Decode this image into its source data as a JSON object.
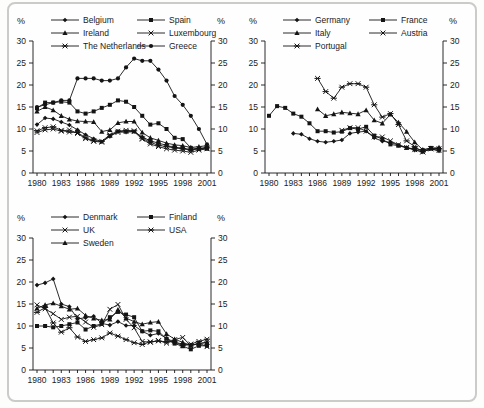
{
  "figure": {
    "border_color": "#c9ccc8",
    "background_color": "#fefefe",
    "line_color": "#141414"
  },
  "chart_data": [
    {
      "type": "line",
      "position": "top-left",
      "title": "",
      "ylabel_left": "%",
      "ylabel_right": "%",
      "ylim": [
        0,
        30
      ],
      "y_ticks": [
        0,
        5,
        10,
        15,
        20,
        25,
        30
      ],
      "x_tick_years": [
        1980,
        1983,
        1986,
        1989,
        1992,
        1995,
        1998,
        2001
      ],
      "years": [
        1980,
        1981,
        1982,
        1983,
        1984,
        1985,
        1986,
        1987,
        1988,
        1989,
        1990,
        1991,
        1992,
        1993,
        1994,
        1995,
        1996,
        1997,
        1998,
        1999,
        2000,
        2001
      ],
      "grid": false,
      "legend_position": "top",
      "series": [
        {
          "name": "Belgium",
          "marker": "diamond",
          "values": [
            11,
            12.5,
            12.3,
            11.6,
            10.9,
            9.8,
            8.7,
            7.8,
            7.1,
            8.3,
            9.5,
            9.3,
            9.4,
            8.2,
            7.3,
            6.8,
            6.3,
            5.8,
            5.7,
            5.3,
            5.6,
            5.8
          ]
        },
        {
          "name": "Spain",
          "marker": "square",
          "values": [
            14.7,
            16,
            16,
            16.2,
            16,
            14,
            13.5,
            14,
            14.8,
            15.5,
            16.5,
            16.2,
            15,
            13,
            11,
            11.3,
            10,
            8,
            7.7,
            5.7,
            5.5,
            5.5
          ]
        },
        {
          "name": "Ireland",
          "marker": "triangle",
          "values": [
            14,
            15,
            14.3,
            13,
            12.2,
            11.8,
            11.7,
            11.6,
            9.4,
            9.8,
            11.4,
            11.7,
            11.7,
            9.2,
            8,
            7.4,
            6.8,
            6.4,
            6.2,
            5.8,
            6,
            6.2
          ]
        },
        {
          "name": "Luxembourg",
          "marker": "x",
          "values": [
            9.2,
            9.8,
            10,
            9.5,
            9.8,
            9,
            7.8,
            7.2,
            7,
            8.5,
            9.2,
            9.4,
            9.4,
            7.7,
            6.6,
            6,
            5.5,
            5.2,
            5,
            4.7,
            5.2,
            5.5
          ]
        },
        {
          "name": "The Netherlands",
          "marker": "asterisk",
          "values": [
            9.6,
            10.3,
            10.5,
            9.7,
            9.3,
            9.2,
            8,
            7.3,
            7.2,
            8.7,
            9.5,
            9.7,
            9.6,
            7.9,
            7,
            6.3,
            6,
            5.7,
            5.5,
            5.2,
            5.5,
            5.7
          ]
        },
        {
          "name": "Greece",
          "marker": "circle",
          "values": [
            15,
            15.5,
            16,
            16.5,
            16.5,
            21.5,
            21.5,
            21.5,
            21,
            21,
            21.5,
            24,
            26,
            25.5,
            25.5,
            23.5,
            21,
            17.5,
            15.5,
            13,
            10,
            6.5
          ]
        }
      ]
    },
    {
      "type": "line",
      "position": "top-right",
      "title": "",
      "ylabel_left": "%",
      "ylabel_right": "%",
      "ylim": [
        0,
        30
      ],
      "y_ticks": [
        0,
        5,
        10,
        15,
        20,
        25,
        30
      ],
      "x_tick_years": [
        1980,
        1983,
        1986,
        1989,
        1992,
        1995,
        1998,
        2001
      ],
      "years": [
        1980,
        1981,
        1982,
        1983,
        1984,
        1985,
        1986,
        1987,
        1988,
        1989,
        1990,
        1991,
        1992,
        1993,
        1994,
        1995,
        1996,
        1997,
        1998,
        1999,
        2000,
        2001
      ],
      "grid": false,
      "legend_position": "top",
      "series": [
        {
          "name": "Germany",
          "marker": "diamond",
          "values": [
            null,
            null,
            null,
            9,
            8.8,
            7.8,
            7.2,
            7,
            7.2,
            7.5,
            9,
            9.3,
            9.5,
            8,
            7.2,
            7,
            6.3,
            5.8,
            5.2,
            4.8,
            5.5,
            5
          ]
        },
        {
          "name": "France",
          "marker": "square",
          "values": [
            13,
            15.2,
            14.8,
            13.5,
            12.8,
            11.3,
            9.5,
            9.5,
            9.2,
            9.4,
            10.2,
            10,
            10.5,
            8.5,
            7.7,
            6.5,
            6.2,
            5.7,
            5.5,
            5.2,
            5.7,
            5.5
          ]
        },
        {
          "name": "Italy",
          "marker": "triangle",
          "values": [
            null,
            null,
            null,
            null,
            null,
            null,
            14.5,
            13,
            13.4,
            13.8,
            13.6,
            13.4,
            14.3,
            12,
            11.3,
            13.3,
            11.5,
            9.4,
            7,
            5.3,
            5.6,
            5.8
          ]
        },
        {
          "name": "Austria",
          "marker": "x",
          "values": [
            null,
            null,
            null,
            null,
            null,
            null,
            null,
            null,
            null,
            9.7,
            10.3,
            10.3,
            9.5,
            8.2,
            8.2,
            7.3,
            6.4,
            5.8,
            5.3,
            4.8,
            5.5,
            5.1
          ]
        },
        {
          "name": "Portugal",
          "marker": "asterisk",
          "values": [
            null,
            null,
            null,
            null,
            null,
            null,
            21.5,
            18.5,
            17,
            19.5,
            20.3,
            20.3,
            19.5,
            15.5,
            12.7,
            13.5,
            11,
            7.3,
            6,
            4.8,
            5.5,
            5.5
          ]
        }
      ]
    },
    {
      "type": "line",
      "position": "bottom-left",
      "title": "",
      "ylabel_left": "%",
      "ylabel_right": "%",
      "ylim": [
        0,
        30
      ],
      "y_ticks": [
        0,
        5,
        10,
        15,
        20,
        25,
        30
      ],
      "x_tick_years": [
        1980,
        1983,
        1986,
        1989,
        1992,
        1995,
        1998,
        2001
      ],
      "years": [
        1980,
        1981,
        1982,
        1983,
        1984,
        1985,
        1986,
        1987,
        1988,
        1989,
        1990,
        1991,
        1992,
        1993,
        1994,
        1995,
        1996,
        1997,
        1998,
        1999,
        2000,
        2001
      ],
      "grid": false,
      "legend_position": "top",
      "series": [
        {
          "name": "Denmark",
          "marker": "diamond",
          "values": [
            19.3,
            19.8,
            20.7,
            15,
            14.4,
            11.6,
            11.9,
            12.2,
            10.6,
            10.2,
            11,
            10.1,
            10.1,
            8.8,
            7.9,
            8.3,
            7.2,
            6.3,
            5.9,
            5.6,
            6,
            6.3
          ]
        },
        {
          "name": "Finland",
          "marker": "square",
          "values": [
            10,
            10,
            9.7,
            10,
            10.4,
            10.8,
            9.2,
            10,
            10.5,
            12,
            13.2,
            12.6,
            12,
            8.8,
            9,
            8.8,
            7.1,
            6,
            5.4,
            4.7,
            5.5,
            5.5
          ]
        },
        {
          "name": "UK",
          "marker": "x",
          "values": [
            14.8,
            13.9,
            12.8,
            11.5,
            12,
            12.2,
            10.9,
            9.7,
            10.3,
            13.8,
            14.9,
            11.5,
            9.6,
            6.5,
            6.3,
            6.7,
            6.1,
            6.9,
            7.4,
            5.5,
            6.1,
            5.3
          ]
        },
        {
          "name": "USA",
          "marker": "asterisk",
          "values": [
            13.1,
            14.2,
            10.7,
            8.6,
            9.6,
            7.5,
            6.5,
            6.9,
            7.3,
            8.4,
            7.7,
            6.9,
            6.2,
            5.8,
            6.4,
            6.6,
            6.4,
            6.4,
            5.5,
            5.9,
            6.5,
            7
          ]
        },
        {
          "name": "Sweden",
          "marker": "triangle",
          "values": [
            14,
            14.8,
            15.2,
            14.5,
            13.8,
            14,
            12.4,
            11.7,
            11.3,
            11.5,
            13.7,
            11.8,
            11,
            10.4,
            10.8,
            11,
            8.2,
            7,
            6.3,
            5.6,
            6,
            6.3
          ]
        }
      ]
    }
  ]
}
